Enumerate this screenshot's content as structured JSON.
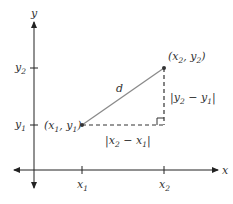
{
  "diagram": {
    "type": "distance-formula",
    "colors": {
      "axis": "#222222",
      "segment": "#8a8a8a",
      "dashed": "#333333",
      "point": "#333333",
      "text": "#333333"
    },
    "axes": {
      "x_label": "x",
      "y_label": "y",
      "x_ticks": [
        {
          "base": "x",
          "sub": "1"
        },
        {
          "base": "x",
          "sub": "2"
        }
      ],
      "y_ticks": [
        {
          "base": "y",
          "sub": "2"
        },
        {
          "base": "y",
          "sub": "1"
        }
      ]
    },
    "points": [
      {
        "name": "P1",
        "label": "(x1, y1)"
      },
      {
        "name": "P2",
        "label": "(x2, y2)"
      }
    ],
    "segment_label": "d",
    "horizontal_leg_label": "|x2 − x1|",
    "vertical_leg_label": "|y2 − y1|"
  }
}
